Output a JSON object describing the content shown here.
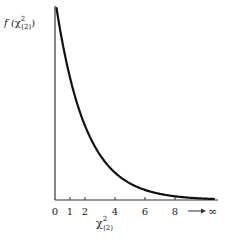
{
  "chart_data": {
    "type": "line",
    "title": "",
    "xlabel": "χ²(2)",
    "ylabel": "f(χ²(2))",
    "xlabel_parts": {
      "base": "χ",
      "sup": "2",
      "sub": "(2)"
    },
    "ylabel_parts": {
      "prefix": "f (",
      "base": "χ",
      "sup": "2",
      "sub": "(2)",
      "suffix": ")"
    },
    "x_ticks": [
      "0",
      "1",
      "2",
      "4",
      "6",
      "8"
    ],
    "x_tick_values": [
      0,
      1,
      2,
      4,
      6,
      8
    ],
    "x_infinity_label": "→ ∞",
    "xlim": [
      0,
      10
    ],
    "grid": false,
    "legend": null,
    "series": [
      {
        "name": "chi-square density, 2 df",
        "function": "f(x) = 0.5 * exp(-x/2)",
        "x": [
          0,
          0.5,
          1,
          1.5,
          2,
          3,
          4,
          5,
          6,
          7,
          8,
          9,
          10
        ],
        "values": [
          0.5,
          0.389,
          0.303,
          0.236,
          0.184,
          0.112,
          0.068,
          0.041,
          0.025,
          0.015,
          0.009,
          0.006,
          0.003
        ]
      }
    ]
  }
}
